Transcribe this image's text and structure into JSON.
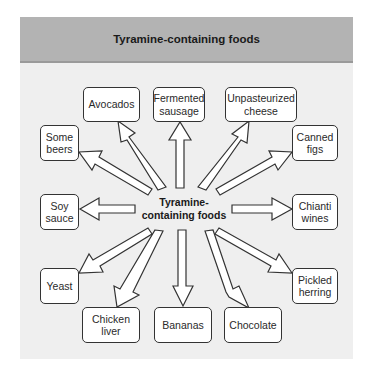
{
  "header": {
    "title": "Tyramine-containing foods"
  },
  "center": {
    "label": "Tyramine-\ncontaining foods"
  },
  "foods": [
    {
      "id": "avocados",
      "label": "Avocados"
    },
    {
      "id": "fermented-sausage",
      "label": "Fermented\nsausage"
    },
    {
      "id": "unpasteurized-cheese",
      "label": "Unpasteurized\ncheese"
    },
    {
      "id": "some-beers",
      "label": "Some\nbeers"
    },
    {
      "id": "canned-figs",
      "label": "Canned\nfigs"
    },
    {
      "id": "soy-sauce",
      "label": "Soy\nsauce"
    },
    {
      "id": "chianti-wines",
      "label": "Chianti\nwines"
    },
    {
      "id": "yeast",
      "label": "Yeast"
    },
    {
      "id": "pickled-herring",
      "label": "Pickled\nherring"
    },
    {
      "id": "chicken-liver",
      "label": "Chicken\nliver"
    },
    {
      "id": "bananas",
      "label": "Bananas"
    },
    {
      "id": "chocolate",
      "label": "Chocolate"
    }
  ],
  "colors": {
    "header_bg": "#b3b3b3",
    "panel_bg": "#efefef",
    "box_bg": "#ffffff",
    "stroke": "#333333"
  }
}
